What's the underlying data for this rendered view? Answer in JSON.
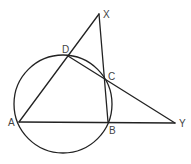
{
  "diagram": {
    "type": "geometry",
    "points": {
      "A": {
        "label": "A"
      },
      "B": {
        "label": "B"
      },
      "C": {
        "label": "C"
      },
      "D": {
        "label": "D"
      },
      "X": {
        "label": "X"
      },
      "Y": {
        "label": "Y"
      }
    },
    "segments": [
      "A-X",
      "X-B",
      "D-Y",
      "A-Y"
    ],
    "circle_through": [
      "A",
      "B",
      "C",
      "D"
    ],
    "colors": {
      "stroke": "#222222",
      "label": "#444444",
      "background": "#ffffff"
    }
  }
}
